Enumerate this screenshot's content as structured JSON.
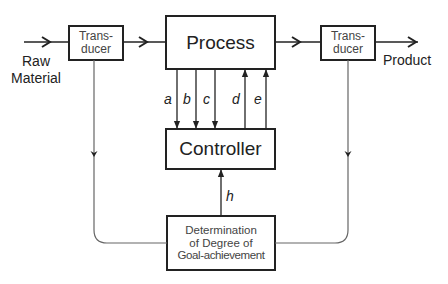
{
  "diagram": {
    "blocks": {
      "transducer_in": {
        "line1": "Trans-",
        "line2": "ducer"
      },
      "process": {
        "label": "Process"
      },
      "transducer_out": {
        "line1": "Trans-",
        "line2": "ducer"
      },
      "controller": {
        "label": "Controller"
      },
      "goal": {
        "line1": "Determination",
        "line2": "of Degree of",
        "line3": "Goal-achievement"
      }
    },
    "io": {
      "input_line1": "Raw",
      "input_line2": "Material",
      "output": "Product"
    },
    "signals": {
      "a": "a",
      "b": "b",
      "c": "c",
      "d": "d",
      "e": "e",
      "h": "h"
    },
    "colors": {
      "line": "#333333",
      "feedback_line": "#666666",
      "text": "#222222",
      "box_text": "#444444"
    }
  }
}
